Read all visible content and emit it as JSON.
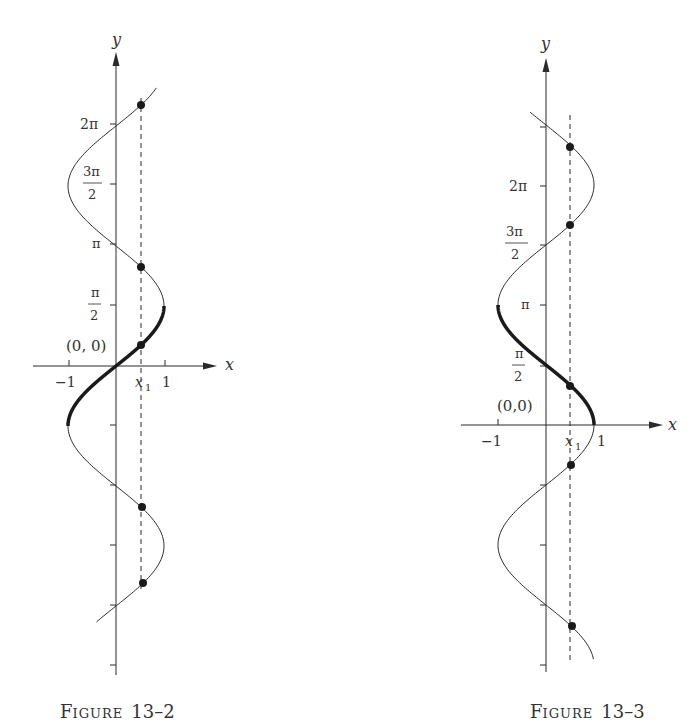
{
  "chart_data": [
    {
      "type": "line",
      "title": "",
      "caption": "Figure 13–2",
      "function": "x = sin y",
      "xlabel": "x",
      "ylabel": "y",
      "x_ticks": [
        "-1",
        "x1",
        "1"
      ],
      "x_tick_values": [
        -1,
        0.52,
        1
      ],
      "y_ticks": [
        "π/2",
        "π",
        "3π/2",
        "2π"
      ],
      "y_tick_values": [
        1.5708,
        3.1416,
        4.7124,
        6.2832
      ],
      "origin_label": "(0, 0)",
      "heavy_segment": {
        "y_from": -1.5708,
        "y_to": 1.5708
      },
      "curve_y_range": [
        -6.7,
        7.28
      ],
      "x1": 0.52,
      "marked_points": [
        {
          "x": 0.52,
          "y": 6.83
        },
        {
          "x": 0.52,
          "y": 2.594
        },
        {
          "x": 0.52,
          "y": 0.547
        },
        {
          "x": 0.52,
          "y": -3.689
        },
        {
          "x": 0.52,
          "y": -5.736
        }
      ],
      "dashed_line": "vertical at x = x1"
    },
    {
      "type": "line",
      "title": "",
      "caption": "Figure 13–3",
      "function": "x = cos y",
      "xlabel": "x",
      "ylabel": "y",
      "x_ticks": [
        "-1",
        "x1",
        "1"
      ],
      "x_tick_values": [
        -1,
        0.5,
        1
      ],
      "y_ticks": [
        "π/2",
        "π",
        "3π/2",
        "2π"
      ],
      "y_tick_values": [
        1.5708,
        3.1416,
        4.7124,
        6.2832
      ],
      "origin_label": "(0, 0)",
      "heavy_segment": {
        "y_from": 0,
        "y_to": 3.1416
      },
      "curve_y_range": [
        -6.13,
        8.19
      ],
      "x1": 0.5,
      "marked_points": [
        {
          "x": 0.5,
          "y": 7.33
        },
        {
          "x": 0.5,
          "y": 5.236
        },
        {
          "x": 0.5,
          "y": 1.047
        },
        {
          "x": 0.5,
          "y": -1.047
        },
        {
          "x": 0.5,
          "y": -5.236
        }
      ],
      "dashed_line": "vertical at x = x1"
    }
  ],
  "fig1": {
    "axis_x": "x",
    "axis_y": "y",
    "tick_neg1": "−1",
    "tick_pos1": "1",
    "tick_x1": "x",
    "tick_x1_sub": "1",
    "y_2pi": "2π",
    "y_3pi_num": "3π",
    "y_3pi_den": "2",
    "y_pi": "π",
    "y_pi2_num": "π",
    "y_pi2_den": "2",
    "origin": "(0, 0)",
    "caption_F": "F",
    "caption_rest": "IGURE",
    "caption_num": "13–2"
  },
  "fig2": {
    "axis_x": "x",
    "axis_y": "y",
    "tick_neg1": "−1",
    "tick_pos1": "1",
    "tick_x1": "x",
    "tick_x1_sub": "1",
    "y_2pi": "2π",
    "y_3pi_num": "3π",
    "y_3pi_den": "2",
    "y_pi": "π",
    "y_pi2_num": "π",
    "y_pi2_den": "2",
    "origin": "(0,0)",
    "caption_F": "F",
    "caption_rest": "IGURE",
    "caption_num": "13–3"
  },
  "colors": {
    "ink": "#2a2a2a",
    "background": "#ffffff"
  }
}
